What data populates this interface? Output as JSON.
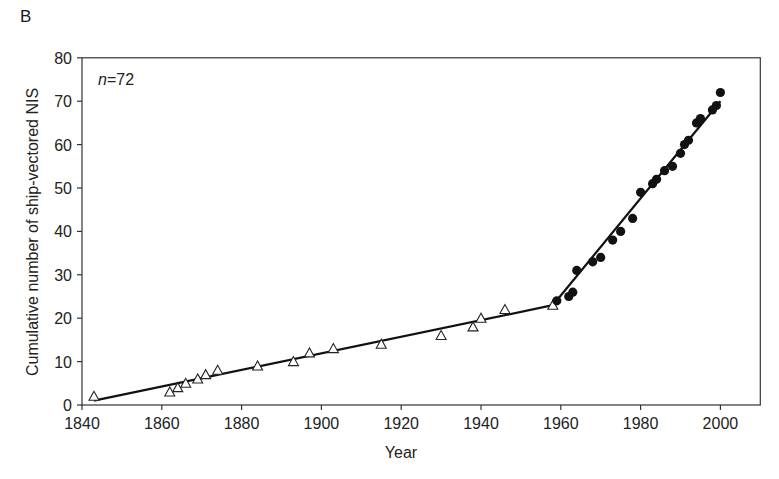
{
  "panel_label": "B",
  "chart_data": {
    "type": "scatter",
    "title": "",
    "panel": "B",
    "xlabel": "Year",
    "ylabel": "Cumulative number of ship-vectored NIS",
    "xlim": [
      1840,
      2010
    ],
    "ylim": [
      0,
      80
    ],
    "x_ticks": [
      1840,
      1860,
      1880,
      1900,
      1920,
      1940,
      1960,
      1980,
      2000
    ],
    "y_ticks": [
      0,
      10,
      20,
      30,
      40,
      50,
      60,
      70,
      80
    ],
    "grid": false,
    "legend": null,
    "annotation": "n = 72",
    "series": [
      {
        "name": "Pre-1960 (open triangles)",
        "marker": "open-triangle",
        "x": [
          1843,
          1862,
          1864,
          1866,
          1869,
          1871,
          1874,
          1884,
          1893,
          1897,
          1903,
          1915,
          1930,
          1938,
          1940,
          1946,
          1958
        ],
        "y": [
          2,
          3,
          4,
          5,
          6,
          7,
          8,
          9,
          10,
          12,
          13,
          14,
          16,
          18,
          20,
          22,
          23
        ]
      },
      {
        "name": "Post-1958 (filled circles)",
        "marker": "filled-circle",
        "x": [
          1959,
          1962,
          1963,
          1964,
          1968,
          1970,
          1973,
          1975,
          1978,
          1980,
          1983,
          1984,
          1986,
          1988,
          1990,
          1991,
          1992,
          1994,
          1995,
          1998,
          1999,
          2000
        ],
        "y": [
          24,
          25,
          26,
          31,
          33,
          34,
          38,
          40,
          43,
          49,
          51,
          52,
          54,
          55,
          58,
          60,
          61,
          65,
          66,
          68,
          69,
          72
        ]
      }
    ],
    "fit_lines": [
      {
        "name": "segment-1",
        "x": [
          1843,
          1958
        ],
        "y": [
          1,
          23
        ]
      },
      {
        "name": "segment-2",
        "x": [
          1958,
          2000
        ],
        "y": [
          23,
          70
        ]
      }
    ]
  }
}
